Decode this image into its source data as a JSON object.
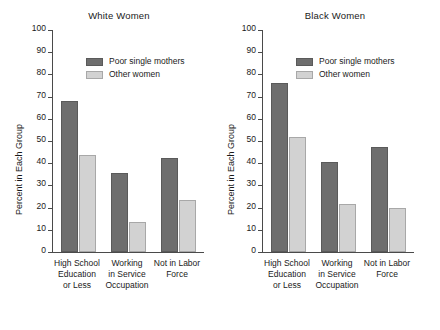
{
  "chart_data": [
    {
      "type": "bar",
      "title": "White Women",
      "xlabel": "",
      "ylabel": "Percent in Each Group",
      "ylim": [
        0,
        100
      ],
      "yticks": [
        0,
        10,
        20,
        30,
        40,
        50,
        60,
        70,
        80,
        90,
        100
      ],
      "grid": false,
      "legend_position": "upper center",
      "categories": [
        "High School Education or Less",
        "Working in Service Occupation",
        "Not in Labor Force"
      ],
      "category_lines": [
        [
          "High School",
          "Education",
          "or Less"
        ],
        [
          "Working",
          "in Service",
          "Occupation"
        ],
        [
          "Not in Labor",
          "Force"
        ]
      ],
      "series": [
        {
          "name": "Poor single mothers",
          "color": "#6e6e6e",
          "values": [
            68,
            35.5,
            42.5
          ]
        },
        {
          "name": "Other women",
          "color": "#d2d2d2",
          "values": [
            43.5,
            13.5,
            23.5
          ]
        }
      ]
    },
    {
      "type": "bar",
      "title": "Black Women",
      "xlabel": "",
      "ylabel": "Percent in Each Group",
      "ylim": [
        0,
        100
      ],
      "yticks": [
        0,
        10,
        20,
        30,
        40,
        50,
        60,
        70,
        80,
        90,
        100
      ],
      "grid": false,
      "legend_position": "upper center",
      "categories": [
        "High School Education or Less",
        "Working in Service Occupation",
        "Not in Labor Force"
      ],
      "category_lines": [
        [
          "High School",
          "Education",
          "or Less"
        ],
        [
          "Working",
          "in Service",
          "Occupation"
        ],
        [
          "Not in Labor",
          "Force"
        ]
      ],
      "series": [
        {
          "name": "Poor single mothers",
          "color": "#6e6e6e",
          "values": [
            76,
            40.5,
            47.5
          ]
        },
        {
          "name": "Other women",
          "color": "#d2d2d2",
          "values": [
            52,
            21.5,
            20
          ]
        }
      ]
    }
  ]
}
